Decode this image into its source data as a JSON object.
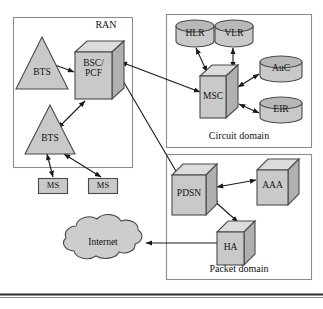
{
  "figure": {
    "fill_color": "#c9c9c9",
    "fill_top_color": "#dcdcdc",
    "fill_side_color": "#b3b3b3",
    "stroke_color": "#444444",
    "text_color": "#111111"
  },
  "groups": [
    {
      "name": "ran",
      "label": "RAN",
      "label_align": "right"
    },
    {
      "name": "circuit",
      "label": "Circuit domain",
      "label_align": "center"
    },
    {
      "name": "packet",
      "label": "Packet domain",
      "label_align": "center"
    }
  ],
  "nodes": {
    "bts_upper": {
      "label": "BTS",
      "shape": "triangle"
    },
    "bts_lower": {
      "label": "BTS",
      "shape": "triangle"
    },
    "bsc_pcf": {
      "label_line1": "BSC/",
      "label_line2": "PCF",
      "shape": "cube"
    },
    "ms_left": {
      "label": "MS",
      "shape": "rect"
    },
    "ms_right": {
      "label": "MS",
      "shape": "rect"
    },
    "hlr": {
      "label": "HLR",
      "shape": "cylinder"
    },
    "vlr": {
      "label": "VLR",
      "shape": "cylinder"
    },
    "auc": {
      "label": "AuC",
      "shape": "cylinder"
    },
    "eir": {
      "label": "EIR",
      "shape": "cylinder"
    },
    "msc": {
      "label": "MSC",
      "shape": "cube"
    },
    "pdsn": {
      "label": "PDSN",
      "shape": "cube"
    },
    "aaa": {
      "label": "AAA",
      "shape": "cube"
    },
    "ha": {
      "label": "HA",
      "shape": "cube"
    },
    "internet": {
      "label": "Internet",
      "shape": "cloud"
    }
  },
  "connections": [
    {
      "from": "bsc_pcf",
      "to": "bts_upper",
      "arrows": "both"
    },
    {
      "from": "bsc_pcf",
      "to": "bts_lower",
      "arrows": "both"
    },
    {
      "from": "bts_lower",
      "to": "ms_left",
      "arrows": "both"
    },
    {
      "from": "bts_lower",
      "to": "ms_right",
      "arrows": "both"
    },
    {
      "from": "bsc_pcf",
      "to": "msc",
      "arrows": "both"
    },
    {
      "from": "bsc_pcf",
      "to": "pdsn",
      "arrows": "both"
    },
    {
      "from": "msc",
      "to": "hlr",
      "arrows": "both"
    },
    {
      "from": "msc",
      "to": "vlr",
      "arrows": "both"
    },
    {
      "from": "msc",
      "to": "auc",
      "arrows": "both"
    },
    {
      "from": "msc",
      "to": "eir",
      "arrows": "both"
    },
    {
      "from": "pdsn",
      "to": "aaa",
      "arrows": "both"
    },
    {
      "from": "pdsn",
      "to": "ha",
      "arrows": "both"
    },
    {
      "from": "ha",
      "to": "internet",
      "arrows": "single"
    }
  ]
}
